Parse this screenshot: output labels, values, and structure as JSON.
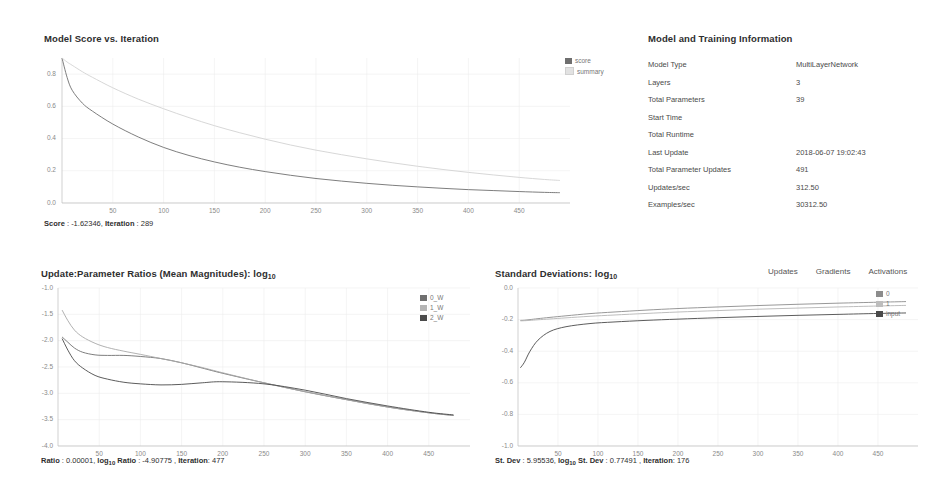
{
  "score_panel": {
    "title": "Model Score vs. Iteration",
    "legend": [
      {
        "label": "score",
        "color": "#6f6f6f"
      },
      {
        "label": "summary",
        "color": "#d9d9d9"
      }
    ],
    "status": {
      "score_label": "Score",
      "score_value": "-1.62346",
      "iteration_label": "Iteration",
      "iteration_value": "289"
    }
  },
  "model_info": {
    "title": "Model and Training Information",
    "rows": [
      {
        "key": "Model Type",
        "value": "MultiLayerNetwork"
      },
      {
        "key": "Layers",
        "value": "3"
      },
      {
        "key": "Total Parameters",
        "value": "39"
      },
      {
        "key": "Start Time",
        "value": ""
      },
      {
        "key": "Total Runtime",
        "value": ""
      },
      {
        "key": "Last Update",
        "value": "2018-06-07 19:02:43"
      },
      {
        "key": "Total Parameter Updates",
        "value": "491"
      },
      {
        "key": "Updates/sec",
        "value": "312.50"
      },
      {
        "key": "Examples/sec",
        "value": "30312.50"
      }
    ]
  },
  "ratios_panel": {
    "title_main": "Update:Parameter Ratios (Mean Magnitudes): log",
    "title_sub": "10",
    "legend": [
      {
        "label": "0_W",
        "color": "#6f6f6f"
      },
      {
        "label": "1_W",
        "color": "#a8a8a8"
      },
      {
        "label": "2_W",
        "color": "#4a4a4a"
      }
    ],
    "status": {
      "ratio_label": "Ratio",
      "ratio_value": "0.00001",
      "log_label": "log",
      "log_sub": "10",
      "log_ratio_label": "Ratio",
      "log_ratio_value": "-4.90775",
      "iteration_label": "Iteration",
      "iteration_value": "477"
    }
  },
  "stddev_panel": {
    "title_main": "Standard Deviations: log",
    "title_sub": "10",
    "tabs": [
      {
        "label": "Updates"
      },
      {
        "label": "Gradients"
      },
      {
        "label": "Activations"
      }
    ],
    "legend": [
      {
        "label": "0",
        "color": "#8c8c8c"
      },
      {
        "label": "1",
        "color": "#b5b5b5"
      },
      {
        "label": "input",
        "color": "#4a4a4a"
      }
    ],
    "status": {
      "stdev_label": "St. Dev",
      "stdev_value": "5.95536",
      "log_label": "log",
      "log_sub": "10",
      "log_stdev_label": "St. Dev",
      "log_stdev_value": "0.77491",
      "iteration_label": "Iteration",
      "iteration_value": "176"
    }
  },
  "chart_data": [
    {
      "type": "line",
      "id": "model-score-vs-iteration",
      "title": "Model Score vs. Iteration",
      "xlabel": "",
      "ylabel": "",
      "xlim": [
        0,
        500
      ],
      "ylim": [
        0.0,
        0.9
      ],
      "xticks": [
        50,
        100,
        150,
        200,
        250,
        300,
        350,
        400,
        450
      ],
      "yticks": [
        0.0,
        0.2,
        0.4,
        0.6,
        0.8
      ],
      "grid": true,
      "legend_position": "top-right-outside",
      "x": [
        0,
        5,
        10,
        20,
        30,
        50,
        75,
        100,
        125,
        150,
        175,
        200,
        225,
        250,
        275,
        300,
        325,
        350,
        375,
        400,
        425,
        450,
        475,
        490
      ],
      "series": [
        {
          "name": "score",
          "color": "#6f6f6f",
          "values": [
            0.9,
            0.78,
            0.7,
            0.62,
            0.57,
            0.49,
            0.41,
            0.345,
            0.295,
            0.255,
            0.222,
            0.195,
            0.172,
            0.152,
            0.136,
            0.122,
            0.11,
            0.1,
            0.091,
            0.083,
            0.077,
            0.071,
            0.066,
            0.064
          ]
        },
        {
          "name": "summary",
          "color": "#d2d2d2",
          "values": [
            0.9,
            0.875,
            0.855,
            0.815,
            0.78,
            0.715,
            0.645,
            0.585,
            0.53,
            0.48,
            0.436,
            0.396,
            0.36,
            0.328,
            0.3,
            0.274,
            0.25,
            0.228,
            0.208,
            0.19,
            0.174,
            0.159,
            0.146,
            0.14
          ]
        }
      ]
    },
    {
      "type": "line",
      "id": "update-parameter-ratios",
      "title": "Update:Parameter Ratios (Mean Magnitudes): log10",
      "xlabel": "",
      "ylabel": "",
      "xlim": [
        0,
        500
      ],
      "ylim": [
        -4.0,
        -1.0
      ],
      "xticks": [
        50,
        100,
        150,
        200,
        250,
        300,
        350,
        400,
        450
      ],
      "yticks": [
        -1.0,
        -1.5,
        -2.0,
        -2.5,
        -3.0,
        -3.5,
        -4.0
      ],
      "grid": true,
      "legend_position": "right-outside",
      "x": [
        5,
        12,
        20,
        30,
        45,
        60,
        80,
        100,
        125,
        150,
        175,
        200,
        250,
        300,
        350,
        400,
        450,
        480
      ],
      "series": [
        {
          "name": "0_W",
          "color": "#6f6f6f",
          "values": [
            -1.93,
            -2.03,
            -2.14,
            -2.22,
            -2.27,
            -2.28,
            -2.28,
            -2.3,
            -2.34,
            -2.42,
            -2.52,
            -2.62,
            -2.8,
            -2.97,
            -3.12,
            -3.26,
            -3.37,
            -3.42
          ]
        },
        {
          "name": "1_W",
          "color": "#a8a8a8",
          "values": [
            -1.42,
            -1.62,
            -1.8,
            -1.93,
            -2.05,
            -2.13,
            -2.2,
            -2.26,
            -2.34,
            -2.42,
            -2.51,
            -2.61,
            -2.8,
            -2.97,
            -3.12,
            -3.26,
            -3.37,
            -3.42
          ]
        },
        {
          "name": "2_W",
          "color": "#4a4a4a",
          "values": [
            -1.96,
            -2.18,
            -2.38,
            -2.52,
            -2.66,
            -2.73,
            -2.79,
            -2.82,
            -2.84,
            -2.83,
            -2.8,
            -2.78,
            -2.82,
            -2.94,
            -3.1,
            -3.24,
            -3.36,
            -3.41
          ]
        }
      ]
    },
    {
      "type": "line",
      "id": "standard-deviations",
      "title": "Standard Deviations: log10",
      "xlabel": "",
      "ylabel": "",
      "xlim": [
        0,
        500
      ],
      "ylim": [
        -1.0,
        0.0
      ],
      "xticks": [
        50,
        100,
        150,
        200,
        250,
        300,
        350,
        400,
        450
      ],
      "yticks": [
        0.0,
        -0.2,
        -0.4,
        -0.6,
        -0.8,
        -1.0
      ],
      "grid": true,
      "legend_position": "right-outside",
      "x": [
        3,
        8,
        15,
        25,
        40,
        60,
        90,
        120,
        160,
        200,
        250,
        300,
        350,
        400,
        450,
        485
      ],
      "series": [
        {
          "name": "0",
          "color": "#8c8c8c",
          "values": [
            -0.205,
            -0.204,
            -0.2,
            -0.194,
            -0.186,
            -0.176,
            -0.162,
            -0.152,
            -0.14,
            -0.13,
            -0.12,
            -0.111,
            -0.103,
            -0.096,
            -0.09,
            -0.086
          ]
        },
        {
          "name": "1",
          "color": "#b5b5b5",
          "values": [
            -0.208,
            -0.207,
            -0.205,
            -0.201,
            -0.196,
            -0.189,
            -0.179,
            -0.171,
            -0.161,
            -0.152,
            -0.143,
            -0.134,
            -0.127,
            -0.12,
            -0.114,
            -0.11
          ]
        },
        {
          "name": "input",
          "color": "#4a4a4a",
          "values": [
            -0.505,
            -0.47,
            -0.4,
            -0.33,
            -0.275,
            -0.245,
            -0.225,
            -0.215,
            -0.205,
            -0.197,
            -0.188,
            -0.18,
            -0.173,
            -0.167,
            -0.161,
            -0.158
          ]
        }
      ]
    }
  ]
}
